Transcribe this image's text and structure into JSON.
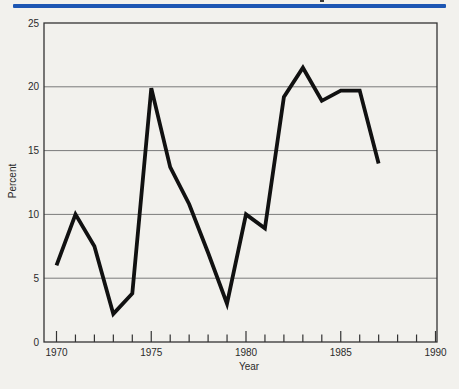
{
  "page": {
    "background_color": "#f2f1ed",
    "top_rule_color": "#1d56b3",
    "artifact_color": "#3a3a3a"
  },
  "chart_data": {
    "type": "line",
    "title": "",
    "xlabel": "Year",
    "ylabel": "Percent",
    "x": [
      1970,
      1971,
      1972,
      1973,
      1974,
      1975,
      1976,
      1977,
      1978,
      1979,
      1980,
      1981,
      1982,
      1983,
      1984,
      1985,
      1986,
      1987
    ],
    "values": [
      6.0,
      10.0,
      7.5,
      2.2,
      3.8,
      19.9,
      13.7,
      10.8,
      7.0,
      3.0,
      10.0,
      8.9,
      19.2,
      21.5,
      18.9,
      19.7,
      19.7,
      14.0
    ],
    "series": [
      {
        "name": "Percent",
        "values": [
          6.0,
          10.0,
          7.5,
          2.2,
          3.8,
          19.9,
          13.7,
          10.8,
          7.0,
          3.0,
          10.0,
          8.9,
          19.2,
          21.5,
          18.9,
          19.7,
          19.7,
          14.0
        ]
      }
    ],
    "xlim": [
      1970,
      1990
    ],
    "ylim": [
      0,
      25
    ],
    "yticks": [
      0,
      5,
      10,
      15,
      20,
      25
    ],
    "xticks_labeled": [
      1970,
      1975,
      1980,
      1985,
      1990
    ],
    "xtick_minor_step": 1,
    "grid": "horizontal",
    "legend": "none",
    "line_color": "#111111",
    "frame_color": "#333333",
    "gridline_color": "#7a7a7a"
  }
}
